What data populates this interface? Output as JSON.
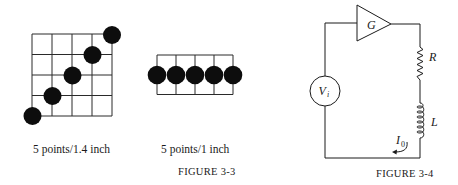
{
  "figure_3_3": {
    "caption": "FIGURE 3-3",
    "left_panel": {
      "label": "5 points/1.4 inch",
      "grid": {
        "columns": 4,
        "rows": 4
      },
      "points": 5,
      "arrangement": "diagonal"
    },
    "right_panel": {
      "label": "5 points/1 inch",
      "grid": {
        "columns": 4,
        "rows": 2
      },
      "points": 5,
      "arrangement": "horizontal"
    }
  },
  "figure_3_4": {
    "caption": "FIGURE 3-4",
    "components": {
      "amplifier": {
        "label": "G"
      },
      "source": {
        "label": "V",
        "subscript": "i"
      },
      "resistor": {
        "label": "R"
      },
      "inductor": {
        "label": "L"
      },
      "current": {
        "label": "I",
        "subscript": "0"
      }
    }
  },
  "colors": {
    "ink": "#1a1a1a",
    "background": "#ffffff"
  }
}
